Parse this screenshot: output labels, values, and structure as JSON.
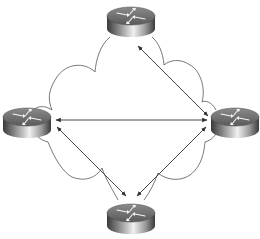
{
  "diagram": {
    "type": "network-topology",
    "colors": {
      "background": "#ffffff",
      "cloud_stroke": "#555555",
      "arrow": "#333333",
      "router_body_dark": "#3a3a3a",
      "router_body_light": "#e8e8e8",
      "router_top": "#6a6a6a",
      "router_top_arrows": "#f4f4f4"
    },
    "cloud": {
      "name": "wan-cloud"
    },
    "routers": [
      {
        "id": "top",
        "name": "router-top",
        "cx": 131,
        "cy": 20
      },
      {
        "id": "left",
        "name": "router-left",
        "cx": 27,
        "cy": 121
      },
      {
        "id": "right",
        "name": "router-right",
        "cx": 235,
        "cy": 121
      },
      {
        "id": "bottom",
        "name": "router-bottom",
        "cx": 131,
        "cy": 217
      }
    ],
    "links": [
      {
        "from": "top",
        "to": "right",
        "x1": 138,
        "y1": 46,
        "x2": 208,
        "y2": 116,
        "bidirectional": true
      },
      {
        "from": "left",
        "to": "right",
        "x1": 56,
        "y1": 120,
        "x2": 207,
        "y2": 120,
        "bidirectional": true
      },
      {
        "from": "left",
        "to": "bottom",
        "x1": 57,
        "y1": 127,
        "x2": 126,
        "y2": 196,
        "bidirectional": true
      },
      {
        "from": "right",
        "to": "bottom",
        "x1": 206,
        "y1": 127,
        "x2": 137,
        "y2": 196,
        "bidirectional": true
      }
    ]
  }
}
